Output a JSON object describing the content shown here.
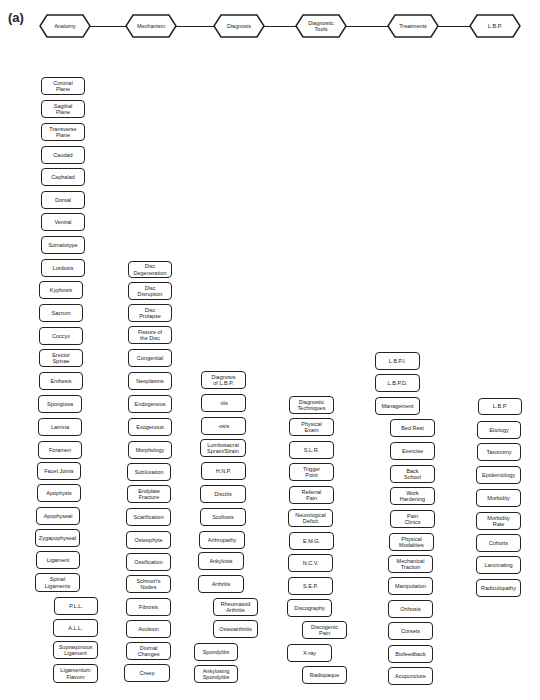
{
  "figure_label": "(a)",
  "header": {
    "categories": [
      {
        "label": "Anatomy",
        "x": 45
      },
      {
        "label": "Mechanism",
        "x": 131
      },
      {
        "label": "Diagnosis",
        "x": 219
      },
      {
        "label": "Diagnostic\nTools",
        "x": 301
      },
      {
        "label": "Treatments",
        "x": 393
      },
      {
        "label": "L.B.P.",
        "x": 475
      }
    ]
  },
  "columns": {
    "anatomy": [
      {
        "label": "Coronal\nPlane",
        "x": 41,
        "y": 77,
        "w": 44,
        "h": 18
      },
      {
        "label": "Sagittal\nPlane",
        "x": 41,
        "y": 100,
        "w": 44,
        "h": 18
      },
      {
        "label": "Transverse\nPlane",
        "x": 41,
        "y": 123,
        "w": 44,
        "h": 18
      },
      {
        "label": "Caudad",
        "x": 41,
        "y": 146,
        "w": 44,
        "h": 18
      },
      {
        "label": "Cephalad",
        "x": 41,
        "y": 168,
        "w": 44,
        "h": 18
      },
      {
        "label": "Dorsal",
        "x": 41,
        "y": 191,
        "w": 44,
        "h": 18
      },
      {
        "label": "Ventral",
        "x": 41,
        "y": 213,
        "w": 44,
        "h": 18
      },
      {
        "label": "Somatotype",
        "x": 41,
        "y": 236,
        "w": 44,
        "h": 18
      },
      {
        "label": "Lordosis",
        "x": 41,
        "y": 259,
        "w": 44,
        "h": 18
      },
      {
        "label": "Kyphosis",
        "x": 39,
        "y": 281,
        "w": 44,
        "h": 18
      },
      {
        "label": "Sacrum",
        "x": 39,
        "y": 304,
        "w": 44,
        "h": 18
      },
      {
        "label": "Coccyx",
        "x": 39,
        "y": 327,
        "w": 44,
        "h": 18
      },
      {
        "label": "Erector\nSpinae",
        "x": 39,
        "y": 349,
        "w": 44,
        "h": 18
      },
      {
        "label": "Enthesis",
        "x": 39,
        "y": 372,
        "w": 44,
        "h": 18
      },
      {
        "label": "Spongiosa",
        "x": 38,
        "y": 395,
        "w": 44,
        "h": 18
      },
      {
        "label": "Lamina",
        "x": 38,
        "y": 418,
        "w": 44,
        "h": 18
      },
      {
        "label": "Foramen",
        "x": 38,
        "y": 441,
        "w": 44,
        "h": 18
      },
      {
        "label": "Facet Joints",
        "x": 37,
        "y": 462,
        "w": 44,
        "h": 18
      },
      {
        "label": "Apophysis",
        "x": 37,
        "y": 484,
        "w": 44,
        "h": 18
      },
      {
        "label": "Apophyseal",
        "x": 36,
        "y": 507,
        "w": 44,
        "h": 18
      },
      {
        "label": "Zygapophyseal",
        "x": 35,
        "y": 529,
        "w": 45,
        "h": 18
      },
      {
        "label": "Ligament",
        "x": 36,
        "y": 551,
        "w": 44,
        "h": 18
      },
      {
        "label": "Spinal\nLigaments",
        "x": 35,
        "y": 573,
        "w": 45,
        "h": 19
      },
      {
        "label": "P.L.L.",
        "x": 54,
        "y": 597,
        "w": 44,
        "h": 18
      },
      {
        "label": "A.L.L.",
        "x": 53,
        "y": 619,
        "w": 45,
        "h": 18
      },
      {
        "label": "Supraspinous\nLigament",
        "x": 53,
        "y": 641,
        "w": 45,
        "h": 18
      },
      {
        "label": "Ligamentum\nFlavum",
        "x": 53,
        "y": 664,
        "w": 45,
        "h": 19
      }
    ],
    "mechanism": [
      {
        "label": "Disc\nDegeneration",
        "x": 128,
        "y": 261,
        "w": 44,
        "h": 17
      },
      {
        "label": "Disc\nDisruption",
        "x": 128,
        "y": 282,
        "w": 44,
        "h": 18
      },
      {
        "label": "Disc\nProlapse",
        "x": 128,
        "y": 304,
        "w": 44,
        "h": 18
      },
      {
        "label": "Fissure of\nthe Disc",
        "x": 128,
        "y": 326,
        "w": 44,
        "h": 18
      },
      {
        "label": "Congenital",
        "x": 128,
        "y": 349,
        "w": 44,
        "h": 18
      },
      {
        "label": "Neoplasms",
        "x": 128,
        "y": 372,
        "w": 44,
        "h": 18
      },
      {
        "label": "Endogenous",
        "x": 128,
        "y": 395,
        "w": 44,
        "h": 18
      },
      {
        "label": "Exogenous",
        "x": 128,
        "y": 418,
        "w": 44,
        "h": 18
      },
      {
        "label": "Morphology",
        "x": 128,
        "y": 441,
        "w": 44,
        "h": 18
      },
      {
        "label": "Subluxation",
        "x": 127,
        "y": 463,
        "w": 44,
        "h": 18
      },
      {
        "label": "Endplate\nFracture",
        "x": 127,
        "y": 485,
        "w": 44,
        "h": 18
      },
      {
        "label": "Scarification",
        "x": 126,
        "y": 508,
        "w": 45,
        "h": 18
      },
      {
        "label": "Osteophyte",
        "x": 126,
        "y": 531,
        "w": 45,
        "h": 18
      },
      {
        "label": "Ossification",
        "x": 126,
        "y": 553,
        "w": 45,
        "h": 18
      },
      {
        "label": "Schmorl's\nNodes",
        "x": 126,
        "y": 575,
        "w": 45,
        "h": 18
      },
      {
        "label": "Fibrosis",
        "x": 126,
        "y": 598,
        "w": 45,
        "h": 18
      },
      {
        "label": "Avulsion",
        "x": 126,
        "y": 620,
        "w": 45,
        "h": 18
      },
      {
        "label": "Diurnal\nChanges",
        "x": 126,
        "y": 642,
        "w": 45,
        "h": 18
      },
      {
        "label": "Creep",
        "x": 124,
        "y": 664,
        "w": 46,
        "h": 18
      }
    ],
    "diagnosis": [
      {
        "label": "Diagnosis\nof L.B.P.",
        "x": 201,
        "y": 371,
        "w": 45,
        "h": 18
      },
      {
        "label": "-itis",
        "x": 201,
        "y": 394,
        "w": 45,
        "h": 18
      },
      {
        "label": "-osis",
        "x": 201,
        "y": 417,
        "w": 45,
        "h": 18
      },
      {
        "label": "Lumbosacral\nSprain/Strain",
        "x": 200,
        "y": 439,
        "w": 46,
        "h": 18
      },
      {
        "label": "H.N.P.",
        "x": 201,
        "y": 462,
        "w": 45,
        "h": 18
      },
      {
        "label": "Discitis",
        "x": 200,
        "y": 485,
        "w": 46,
        "h": 18
      },
      {
        "label": "Scoliosis",
        "x": 200,
        "y": 508,
        "w": 46,
        "h": 18
      },
      {
        "label": "Arthropathy",
        "x": 199,
        "y": 531,
        "w": 46,
        "h": 18
      },
      {
        "label": "Ankylosis",
        "x": 198,
        "y": 552,
        "w": 46,
        "h": 18
      },
      {
        "label": "Arthritis",
        "x": 198,
        "y": 575,
        "w": 46,
        "h": 18
      },
      {
        "label": "Rheumatoid\nArthritis",
        "x": 213,
        "y": 598,
        "w": 45,
        "h": 18
      },
      {
        "label": "Osteoarthritis",
        "x": 213,
        "y": 620,
        "w": 45,
        "h": 18
      },
      {
        "label": "Spondylitis",
        "x": 194,
        "y": 643,
        "w": 44,
        "h": 18
      },
      {
        "label": "Ankylosing\nSpondylitis",
        "x": 194,
        "y": 665,
        "w": 44,
        "h": 18
      }
    ],
    "diagnostic_tools": [
      {
        "label": "Diagnostic\nTechniques",
        "x": 289,
        "y": 396,
        "w": 45,
        "h": 18
      },
      {
        "label": "Physical\nExam",
        "x": 289,
        "y": 418,
        "w": 45,
        "h": 18
      },
      {
        "label": "S.L.R.",
        "x": 289,
        "y": 441,
        "w": 45,
        "h": 18
      },
      {
        "label": "Trigger\nPoint",
        "x": 289,
        "y": 463,
        "w": 45,
        "h": 18
      },
      {
        "label": "Referral\nPain",
        "x": 289,
        "y": 486,
        "w": 45,
        "h": 18
      },
      {
        "label": "Neurological\nDeficit",
        "x": 288,
        "y": 509,
        "w": 45,
        "h": 18
      },
      {
        "label": "E.M.G.",
        "x": 289,
        "y": 532,
        "w": 45,
        "h": 18
      },
      {
        "label": "N.C.V.",
        "x": 288,
        "y": 554,
        "w": 45,
        "h": 18
      },
      {
        "label": "S.E.P.",
        "x": 288,
        "y": 577,
        "w": 45,
        "h": 18
      },
      {
        "label": "Discography",
        "x": 287,
        "y": 599,
        "w": 45,
        "h": 18
      },
      {
        "label": "Discogenic\nPain",
        "x": 302,
        "y": 621,
        "w": 45,
        "h": 18
      },
      {
        "label": "X-ray",
        "x": 287,
        "y": 644,
        "w": 45,
        "h": 18
      },
      {
        "label": "Radiopaque",
        "x": 302,
        "y": 666,
        "w": 45,
        "h": 18
      }
    ],
    "treatments": [
      {
        "label": "L.B.P.I.",
        "x": 375,
        "y": 352,
        "w": 45,
        "h": 18
      },
      {
        "label": "L.B.P.D.",
        "x": 375,
        "y": 374,
        "w": 45,
        "h": 18
      },
      {
        "label": "Management",
        "x": 375,
        "y": 397,
        "w": 45,
        "h": 18
      },
      {
        "label": "Bed Rest",
        "x": 390,
        "y": 419,
        "w": 45,
        "h": 18
      },
      {
        "label": "Exercise",
        "x": 390,
        "y": 442,
        "w": 45,
        "h": 18
      },
      {
        "label": "Back\nSchool",
        "x": 390,
        "y": 465,
        "w": 45,
        "h": 18
      },
      {
        "label": "Work\nHardening",
        "x": 390,
        "y": 487,
        "w": 45,
        "h": 18
      },
      {
        "label": "Pain\nClinics",
        "x": 390,
        "y": 510,
        "w": 45,
        "h": 18
      },
      {
        "label": "Physical\nModalities",
        "x": 389,
        "y": 533,
        "w": 45,
        "h": 18
      },
      {
        "label": "Mechanical\nTraction",
        "x": 388,
        "y": 555,
        "w": 45,
        "h": 18
      },
      {
        "label": "Manipulation",
        "x": 388,
        "y": 577,
        "w": 45,
        "h": 18
      },
      {
        "label": "Orthosis",
        "x": 388,
        "y": 600,
        "w": 45,
        "h": 18
      },
      {
        "label": "Corsets",
        "x": 388,
        "y": 622,
        "w": 45,
        "h": 18
      },
      {
        "label": "Biofeedback",
        "x": 388,
        "y": 645,
        "w": 45,
        "h": 18
      },
      {
        "label": "Acupuncture",
        "x": 388,
        "y": 667,
        "w": 45,
        "h": 18
      }
    ],
    "lbp": [
      {
        "label": "L.B.P.",
        "x": 478,
        "y": 398,
        "w": 44,
        "h": 17
      },
      {
        "label": "Etiology",
        "x": 477,
        "y": 421,
        "w": 44,
        "h": 18
      },
      {
        "label": "Taxonomy",
        "x": 477,
        "y": 443,
        "w": 44,
        "h": 18
      },
      {
        "label": "Epidemiology",
        "x": 476,
        "y": 466,
        "w": 45,
        "h": 18
      },
      {
        "label": "Morbidity",
        "x": 476,
        "y": 489,
        "w": 45,
        "h": 18
      },
      {
        "label": "Morbidity\nRate",
        "x": 476,
        "y": 512,
        "w": 45,
        "h": 18
      },
      {
        "label": "Cohorts",
        "x": 476,
        "y": 534,
        "w": 45,
        "h": 18
      },
      {
        "label": "Lancinating",
        "x": 476,
        "y": 556,
        "w": 45,
        "h": 18
      },
      {
        "label": "Radiculopathy",
        "x": 476,
        "y": 579,
        "w": 45,
        "h": 18
      }
    ]
  }
}
